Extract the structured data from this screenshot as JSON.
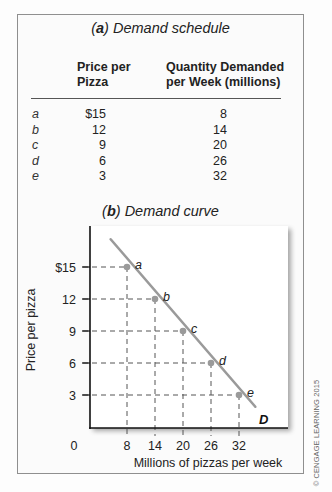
{
  "schedule": {
    "title_letter": "a",
    "title_text": " Demand schedule",
    "col_price_line1": "Price per",
    "col_price_line2": "Pizza",
    "col_qty_line1": "Quantity Demanded",
    "col_qty_line2": "per Week (millions)",
    "rows": [
      {
        "label": "a",
        "price": "$15",
        "qty": "8"
      },
      {
        "label": "b",
        "price": "12",
        "qty": "14"
      },
      {
        "label": "c",
        "price": "9",
        "qty": "20"
      },
      {
        "label": "d",
        "price": "6",
        "qty": "26"
      },
      {
        "label": "e",
        "price": "3",
        "qty": "32"
      }
    ]
  },
  "curve": {
    "title_letter": "b",
    "title_text": " Demand curve",
    "ylabel": "Price per pizza",
    "xlabel": "Millions of pizzas per week",
    "origin_label": "0",
    "curve_label": "D"
  },
  "copyright": "© CENGAGE LEARNING 2015",
  "colors": {
    "curve": "#9a9a9a",
    "point": "#9a9a9a",
    "axis": "#111111",
    "guide": "#555555"
  },
  "chart_data": [
    {
      "type": "table",
      "title": "(a) Demand schedule",
      "columns": [
        "",
        "Price per Pizza",
        "Quantity Demanded per Week (millions)"
      ],
      "rows": [
        [
          "a",
          "$15",
          "8"
        ],
        [
          "b",
          "12",
          "14"
        ],
        [
          "c",
          "9",
          "20"
        ],
        [
          "d",
          "6",
          "26"
        ],
        [
          "e",
          "3",
          "32"
        ]
      ]
    },
    {
      "type": "line",
      "title": "(b) Demand curve",
      "xlabel": "Millions of pizzas per week",
      "ylabel": "Price per pizza",
      "x": [
        8,
        14,
        20,
        26,
        32
      ],
      "series": [
        {
          "name": "D",
          "values": [
            15,
            12,
            9,
            6,
            3
          ],
          "point_labels": [
            "a",
            "b",
            "c",
            "d",
            "e"
          ]
        }
      ],
      "xticks": [
        "0",
        "8",
        "14",
        "20",
        "26",
        "32"
      ],
      "yticks": [
        "3",
        "6",
        "9",
        "12",
        "$15"
      ],
      "xlim": [
        0,
        37
      ],
      "ylim": [
        0,
        19
      ],
      "grid": false,
      "guides": "dashed drop lines from each point to both axes",
      "legend": "curve labeled D at lower-right end"
    }
  ]
}
